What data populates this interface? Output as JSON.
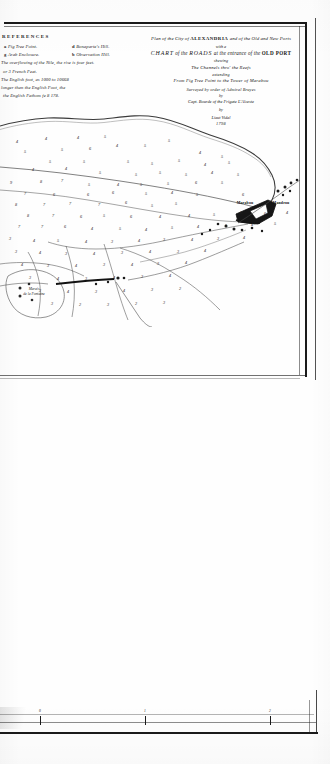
{
  "document": {
    "kind": "engraved-nautical-chart-scan",
    "background_color": "#fefefe",
    "ink_color": "#1a1a1a"
  },
  "legend": {
    "heading": "REFERENCES",
    "rows": [
      {
        "left_key": "a",
        "left_text": "Fig Tree Point.",
        "right_key": "d",
        "right_text": "Bonaparte's Hill."
      },
      {
        "left_key": "g",
        "left_text": "Arab Enclosure.",
        "right_key": "b",
        "right_text": "Observation Hill."
      }
    ],
    "notes": [
      "The overflowing of the Nile, the rise is four feet.",
      "or 3 French Feet.",
      "The English foot, as 1000 to 10668",
      "longer than the English Foot, the",
      "the English Fathom  fe 8  178."
    ]
  },
  "title_block": {
    "line1_pre": "Plan of the City of ",
    "line1_caps": "ALEXANDRIA",
    "line1_post": " and of the Old and New Ports",
    "with_a": "with a",
    "chart_caps": "CHART",
    "chart_of_the": " of the ",
    "chart_roads": "ROADS",
    "chart_at": " at the entrance of the ",
    "chart_oldport": "OLD PORT",
    "shewing": "shewing",
    "channels": "The Channels thro' the Reefs",
    "extending": "extending",
    "extent": "From Fig Tree Point to the Tower of Marabou",
    "surveyed": "Surveyed by order of Admiral Bruyes",
    "by": "by",
    "author": "Capt. Bourde of the Frigate L'Alceste",
    "engraver_by": "by",
    "engraver": "Lieut Vidal",
    "date": "1798"
  },
  "map": {
    "place_labels": [
      {
        "name": "marabou-tower-label",
        "text": "Marabou",
        "x": 245,
        "y": 91,
        "style": "bold"
      },
      {
        "name": "mandrou-label",
        "text": "Mandrou",
        "x": 281,
        "y": 91,
        "style": "bold"
      },
      {
        "name": "marais-fontaine-label",
        "text": "Marais\nde la Fontaine",
        "x": 34,
        "y": 180,
        "style": "italic"
      }
    ],
    "soundings": [
      {
        "v": "4",
        "x": 17,
        "y": 29
      },
      {
        "v": "4",
        "x": 46,
        "y": 26
      },
      {
        "v": "4",
        "x": 78,
        "y": 25
      },
      {
        "v": "5",
        "x": 105,
        "y": 24
      },
      {
        "v": "5",
        "x": 25,
        "y": 39
      },
      {
        "v": "5",
        "x": 62,
        "y": 37
      },
      {
        "v": "6",
        "x": 90,
        "y": 36
      },
      {
        "v": "4",
        "x": 117,
        "y": 33
      },
      {
        "v": "5",
        "x": 145,
        "y": 33
      },
      {
        "v": "5",
        "x": 169,
        "y": 28
      },
      {
        "v": "4",
        "x": 200,
        "y": 40
      },
      {
        "v": "5",
        "x": 222,
        "y": 44
      },
      {
        "v": "5",
        "x": 50,
        "y": 49
      },
      {
        "v": "5",
        "x": 84,
        "y": 49
      },
      {
        "v": "5",
        "x": 128,
        "y": 49
      },
      {
        "v": "152",
        "x": 0,
        "y": 0
      },
      {
        "v": "5",
        "x": 152,
        "y": 51
      },
      {
        "v": "5",
        "x": 179,
        "y": 48
      },
      {
        "v": "4",
        "x": 205,
        "y": 52
      },
      {
        "v": "5",
        "x": 229,
        "y": 50
      },
      {
        "v": "4",
        "x": 33,
        "y": 57
      },
      {
        "v": "4",
        "x": 66,
        "y": 56
      },
      {
        "v": "5",
        "x": 100,
        "y": 60
      },
      {
        "v": "5",
        "x": 136,
        "y": 62
      },
      {
        "v": "5",
        "x": 160,
        "y": 60
      },
      {
        "v": "5",
        "x": 186,
        "y": 62
      },
      {
        "v": "4",
        "x": 212,
        "y": 60
      },
      {
        "v": "5",
        "x": 238,
        "y": 62
      },
      {
        "v": "9",
        "x": 11,
        "y": 70
      },
      {
        "v": "8",
        "x": 41,
        "y": 69
      },
      {
        "v": "7",
        "x": 62,
        "y": 68
      },
      {
        "v": "5",
        "x": 89,
        "y": 72
      },
      {
        "v": "4",
        "x": 118,
        "y": 72
      },
      {
        "v": "5",
        "x": 141,
        "y": 72
      },
      {
        "v": "5",
        "x": 168,
        "y": 71
      },
      {
        "v": "6",
        "x": 196,
        "y": 70
      },
      {
        "v": "5",
        "x": 222,
        "y": 70
      },
      {
        "v": "7",
        "x": 25,
        "y": 81
      },
      {
        "v": "6",
        "x": 54,
        "y": 82
      },
      {
        "v": "6",
        "x": 88,
        "y": 82
      },
      {
        "v": "6",
        "x": 113,
        "y": 80
      },
      {
        "v": "5",
        "x": 146,
        "y": 81
      },
      {
        "v": "4",
        "x": 172,
        "y": 80
      },
      {
        "v": "5",
        "x": 197,
        "y": 82
      },
      {
        "v": "6",
        "x": 243,
        "y": 82
      },
      {
        "v": "8",
        "x": 16,
        "y": 92
      },
      {
        "v": "7",
        "x": 44,
        "y": 92
      },
      {
        "v": "7",
        "x": 70,
        "y": 91
      },
      {
        "v": "7",
        "x": 99,
        "y": 92
      },
      {
        "v": "6",
        "x": 126,
        "y": 90
      },
      {
        "v": "5",
        "x": 152,
        "y": 93
      },
      {
        "v": "5",
        "x": 176,
        "y": 91
      },
      {
        "v": "8",
        "x": 28,
        "y": 103
      },
      {
        "v": "7",
        "x": 53,
        "y": 103
      },
      {
        "v": "6",
        "x": 81,
        "y": 104
      },
      {
        "v": "5",
        "x": 104,
        "y": 103
      },
      {
        "v": "6",
        "x": 131,
        "y": 104
      },
      {
        "v": "4",
        "x": 160,
        "y": 104
      },
      {
        "v": "4",
        "x": 189,
        "y": 103
      },
      {
        "v": "5",
        "x": 214,
        "y": 102
      },
      {
        "v": "5",
        "x": 241,
        "y": 100
      },
      {
        "v": "6",
        "x": 265,
        "y": 101
      },
      {
        "v": "4",
        "x": 287,
        "y": 100
      },
      {
        "v": "7",
        "x": 19,
        "y": 114
      },
      {
        "v": "7",
        "x": 42,
        "y": 114
      },
      {
        "v": "6",
        "x": 65,
        "y": 114
      },
      {
        "v": "4",
        "x": 92,
        "y": 116
      },
      {
        "v": "5",
        "x": 120,
        "y": 116
      },
      {
        "v": "4",
        "x": 146,
        "y": 117
      },
      {
        "v": "5",
        "x": 172,
        "y": 115
      },
      {
        "v": "4",
        "x": 198,
        "y": 114
      },
      {
        "v": "5",
        "x": 226,
        "y": 113
      },
      {
        "v": "4",
        "x": 252,
        "y": 112
      },
      {
        "v": "5",
        "x": 275,
        "y": 111
      },
      {
        "v": "3",
        "x": 10,
        "y": 126
      },
      {
        "v": "4",
        "x": 34,
        "y": 128
      },
      {
        "v": "5",
        "x": 58,
        "y": 128
      },
      {
        "v": "4",
        "x": 86,
        "y": 129
      },
      {
        "v": "3",
        "x": 112,
        "y": 129
      },
      {
        "v": "4",
        "x": 139,
        "y": 128
      },
      {
        "v": "3",
        "x": 164,
        "y": 127
      },
      {
        "v": "4",
        "x": 192,
        "y": 127
      },
      {
        "v": "3",
        "x": 218,
        "y": 126
      },
      {
        "v": "4",
        "x": 244,
        "y": 125
      },
      {
        "v": "3",
        "x": 16,
        "y": 139
      },
      {
        "v": "4",
        "x": 40,
        "y": 140
      },
      {
        "v": "3",
        "x": 66,
        "y": 141
      },
      {
        "v": "4",
        "x": 94,
        "y": 141
      },
      {
        "v": "3",
        "x": 122,
        "y": 140
      },
      {
        "v": "4",
        "x": 150,
        "y": 139
      },
      {
        "v": "3",
        "x": 178,
        "y": 139
      },
      {
        "v": "4",
        "x": 205,
        "y": 138
      },
      {
        "v": "4",
        "x": 22,
        "y": 152
      },
      {
        "v": "3",
        "x": 48,
        "y": 153
      },
      {
        "v": "4",
        "x": 76,
        "y": 153
      },
      {
        "v": "3",
        "x": 104,
        "y": 152
      },
      {
        "v": "4",
        "x": 132,
        "y": 152
      },
      {
        "v": "3",
        "x": 158,
        "y": 151
      },
      {
        "v": "4",
        "x": 186,
        "y": 150
      },
      {
        "v": "3",
        "x": 30,
        "y": 165
      },
      {
        "v": "4",
        "x": 58,
        "y": 166
      },
      {
        "v": "3",
        "x": 86,
        "y": 166
      },
      {
        "v": "4",
        "x": 114,
        "y": 165
      },
      {
        "v": "3",
        "x": 142,
        "y": 164
      },
      {
        "v": "4",
        "x": 170,
        "y": 163
      },
      {
        "v": "3",
        "x": 40,
        "y": 178
      },
      {
        "v": "4",
        "x": 68,
        "y": 179
      },
      {
        "v": "3",
        "x": 96,
        "y": 179
      },
      {
        "v": "4",
        "x": 124,
        "y": 178
      },
      {
        "v": "3",
        "x": 152,
        "y": 177
      },
      {
        "v": "2",
        "x": 180,
        "y": 176
      },
      {
        "v": "3",
        "x": 52,
        "y": 191
      },
      {
        "v": "2",
        "x": 80,
        "y": 192
      },
      {
        "v": "3",
        "x": 108,
        "y": 192
      },
      {
        "v": "2",
        "x": 136,
        "y": 191
      },
      {
        "v": "3",
        "x": 164,
        "y": 190
      }
    ]
  },
  "scale_bar": {
    "ticks": [
      {
        "x": 40,
        "label": "0"
      },
      {
        "x": 145,
        "label": "1"
      },
      {
        "x": 270,
        "label": "2"
      }
    ]
  }
}
